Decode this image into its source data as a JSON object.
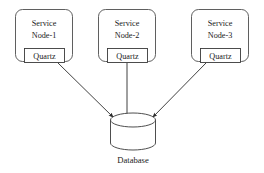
{
  "diagram": {
    "background_color": "#ffffff",
    "stroke_color": "#3a3a3a",
    "text_color": "#1a1a1a",
    "nodes": [
      {
        "id": "service-node-1",
        "label_line1": "Service",
        "label_line2": "Node-1",
        "component_label": "Quartz"
      },
      {
        "id": "service-node-2",
        "label_line1": "Service",
        "label_line2": "Node-2",
        "component_label": "Quartz"
      },
      {
        "id": "service-node-3",
        "label_line1": "Service",
        "label_line2": "Node-3",
        "component_label": "Quartz"
      }
    ],
    "datastore": {
      "id": "database",
      "label": "Database",
      "shape": "cylinder"
    },
    "connections": [
      {
        "from": "service-node-1",
        "to": "database",
        "style": "arrow"
      },
      {
        "from": "service-node-2",
        "to": "database",
        "style": "arrow"
      },
      {
        "from": "service-node-3",
        "to": "database",
        "style": "arrow"
      }
    ]
  }
}
